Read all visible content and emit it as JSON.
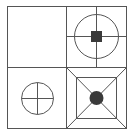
{
  "figure": {
    "type": "2x2 grid puzzle diagram",
    "stroke_color": "#555555",
    "fill_color": "#3a3a3a",
    "background": "#ffffff",
    "cells": [
      {
        "position": "top-left",
        "content": "empty"
      },
      {
        "position": "top-right",
        "content": "large circle with crosshair lines and filled square at center"
      },
      {
        "position": "bottom-left",
        "content": "small circle with cross inside"
      },
      {
        "position": "bottom-right",
        "content": "nested squares with diagonals and filled circle at center"
      }
    ]
  }
}
